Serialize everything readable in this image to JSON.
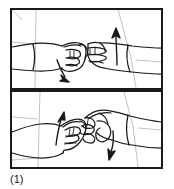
{
  "figure": {
    "caption": "(1)",
    "kind": "line-drawing-illustration",
    "panel_count": 2,
    "colors": {
      "ink": "#1a1a1a",
      "paper": "#ffffff",
      "faint_ink": "#9a9a9a"
    },
    "frame": {
      "label": "outer-frame",
      "stroke_width": 2
    },
    "panels": [
      {
        "id": "panel-top",
        "index": 1,
        "label": "Top panel",
        "description": "Left fist and right fist meeting knuckle to knuckle, seen from the side.",
        "hands": [
          {
            "id": "left-fist-top",
            "side": "left",
            "pose": "closed fist, thumb over fingers, forearm entering from left edge"
          },
          {
            "id": "right-fist-top",
            "side": "right",
            "pose": "closed fist, fingers toward viewer, forearm exiting to right edge"
          }
        ],
        "arrows": [
          {
            "id": "arrow-up-right-hand",
            "label": "Up",
            "direction": "up",
            "attached_to": "right-fist-top"
          },
          {
            "id": "arrow-down-left-hand",
            "label": "Down",
            "direction": "down-right",
            "attached_to": "left-fist-top"
          }
        ]
      },
      {
        "id": "panel-bottom",
        "index": 2,
        "label": "Bottom panel",
        "description": "Left fist rotated, right hand fingers curled over it, reversed motion.",
        "hands": [
          {
            "id": "left-fist-bottom",
            "side": "left",
            "pose": "closed fist angled up, forearm entering from left edge"
          },
          {
            "id": "right-fist-bottom",
            "side": "right",
            "pose": "closed fist with curled fingers, forearm exiting to right edge"
          }
        ],
        "arrows": [
          {
            "id": "arrow-up-left-hand",
            "label": "Up",
            "direction": "up",
            "attached_to": "left-fist-bottom"
          },
          {
            "id": "arrow-down-right-hand",
            "label": "Down",
            "direction": "down",
            "attached_to": "right-fist-bottom"
          }
        ]
      }
    ]
  }
}
